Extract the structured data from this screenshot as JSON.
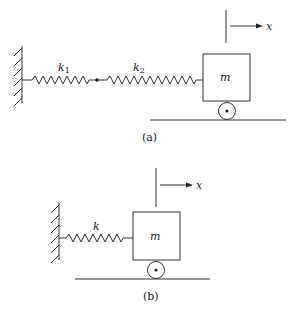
{
  "figure_a": {
    "caption": "(a)",
    "spring1_label": "k",
    "spring1_sub": "1",
    "spring2_label": "k",
    "spring2_sub": "2",
    "mass_label": "m",
    "displacement_label": "x"
  },
  "figure_b": {
    "caption": "(b)",
    "spring_label": "k",
    "mass_label": "m",
    "displacement_label": "x"
  }
}
